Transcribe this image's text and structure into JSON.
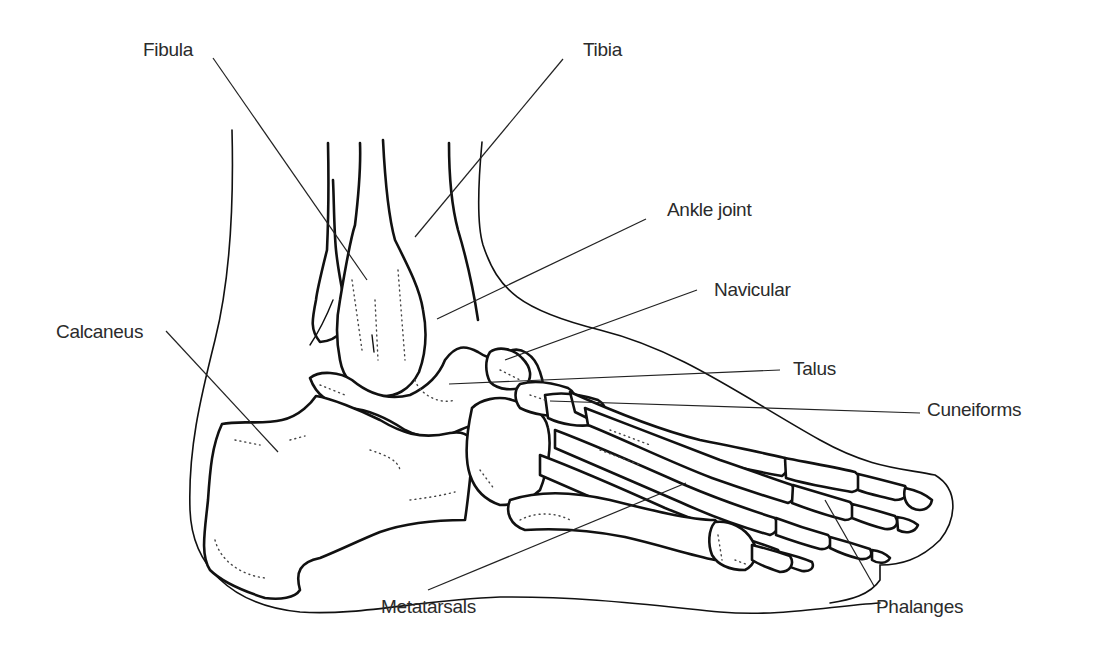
{
  "diagram": {
    "labels": [
      {
        "id": "fibula",
        "text": "Fibula",
        "x": 143,
        "y": 40,
        "line": [
          213,
          58,
          367,
          280
        ]
      },
      {
        "id": "tibia",
        "text": "Tibia",
        "x": 583,
        "y": 40,
        "line": [
          563,
          59,
          415,
          237
        ]
      },
      {
        "id": "ankle-joint",
        "text": "Ankle joint",
        "x": 667,
        "y": 200,
        "line": [
          646,
          219,
          437,
          319
        ]
      },
      {
        "id": "navicular",
        "text": "Navicular",
        "x": 714,
        "y": 280,
        "line": [
          697,
          290,
          505,
          360
        ]
      },
      {
        "id": "talus",
        "text": "Talus",
        "x": 793,
        "y": 359,
        "line": [
          780,
          370,
          449,
          384
        ]
      },
      {
        "id": "calcaneus",
        "text": "Calcaneus",
        "x": 56,
        "y": 322,
        "line": [
          166,
          331,
          278,
          452
        ]
      },
      {
        "id": "cuneiforms",
        "text": "Cuneiforms",
        "x": 927,
        "y": 400,
        "line": [
          920,
          413,
          550,
          401
        ]
      },
      {
        "id": "metatarsals",
        "text": "Metatarsals",
        "x": 381,
        "y": 597,
        "line": [
          428,
          590,
          686,
          483
        ]
      },
      {
        "id": "phalanges",
        "text": "Phalanges",
        "x": 876,
        "y": 597,
        "line": [
          874,
          586,
          825,
          500
        ]
      }
    ]
  }
}
